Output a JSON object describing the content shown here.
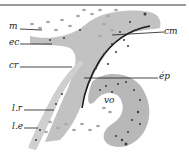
{
  "figure": {
    "type": "histological section diagram",
    "labels": [
      {
        "id": "m",
        "text": "m"
      },
      {
        "id": "ec",
        "text": "ec"
      },
      {
        "id": "cr",
        "text": "cr"
      },
      {
        "id": "cm",
        "text": "cm"
      },
      {
        "id": "ep",
        "text": "ép"
      },
      {
        "id": "vo",
        "text": "vo"
      },
      {
        "id": "lr",
        "text": "l.r"
      },
      {
        "id": "le",
        "text": "l.e"
      }
    ],
    "colors": {
      "tissue": "#bdbdbd",
      "tissue_dark": "#8c8c8c",
      "nuclei": "#3a3a3a",
      "cells": "#b0b0b0",
      "line": "#1a1a1a",
      "frame": "#9a9a9a"
    }
  }
}
